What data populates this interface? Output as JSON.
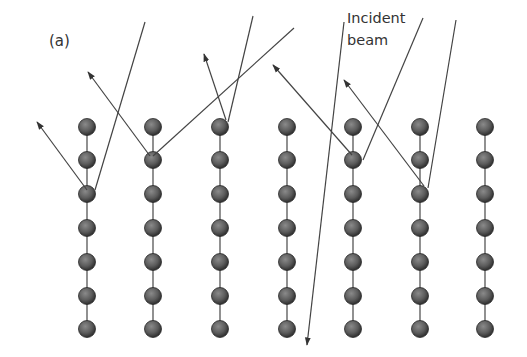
{
  "figure": {
    "panel_label": "(a)",
    "annotation_line1": "Incident",
    "annotation_line2": "beam",
    "columns_x": [
      87,
      153,
      220,
      287,
      353,
      420,
      485
    ],
    "rows_y": [
      127,
      160,
      194,
      228,
      262,
      296,
      329
    ],
    "atom_radius": 8.5,
    "colors": {
      "atom": "#5a5a5a",
      "line": "#444444",
      "bond": "#555555"
    },
    "incident_rays": [
      {
        "from": [
          145,
          22
        ],
        "to": [
          95,
          190
        ]
      },
      {
        "from": [
          294,
          28
        ],
        "to": [
          153,
          156
        ]
      },
      {
        "from": [
          253,
          16
        ],
        "to": [
          228,
          122
        ]
      },
      {
        "from": [
          344,
          22
        ],
        "to": [
          307,
          345
        ]
      },
      {
        "from": [
          423,
          18
        ],
        "to": [
          363,
          160
        ]
      },
      {
        "from": [
          456,
          20
        ],
        "to": [
          428,
          188
        ]
      }
    ],
    "reflected_rays": [
      {
        "from": [
          87,
          190
        ],
        "to": [
          37,
          122
        ]
      },
      {
        "from": [
          150,
          156
        ],
        "to": [
          88,
          72
        ]
      },
      {
        "from": [
          226,
          120
        ],
        "to": [
          204,
          54
        ]
      },
      {
        "from": [
          352,
          155
        ],
        "to": [
          273,
          65
        ]
      },
      {
        "from": [
          424,
          186
        ],
        "to": [
          344,
          80
        ]
      }
    ]
  }
}
